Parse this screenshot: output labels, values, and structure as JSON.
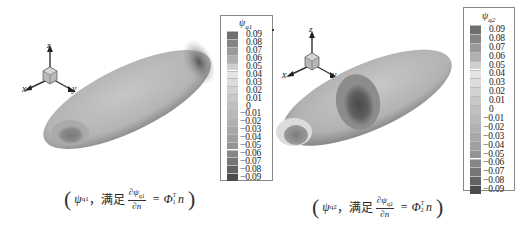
{
  "figure": {
    "panels": [
      {
        "id": "left",
        "colorbar": {
          "title_symbol": "ψ",
          "title_subscript": "q1",
          "ticks": [
            "0.09",
            "0.08",
            "0.07",
            "0.06",
            "0.05",
            "0.04",
            "0.03",
            "0.02",
            "0.01",
            "0",
            "−0.01",
            "−0.02",
            "−0.03",
            "−0.04",
            "−0.05",
            "−0.06",
            "−0.07",
            "−0.08",
            "−0.09"
          ],
          "colors": [
            "#6f6f6f",
            "#858585",
            "#9a9a9a",
            "#b0b0b0",
            "#cfcfcf",
            "#e4e4e4",
            "#dcdcdc",
            "#d2d2d2",
            "#c8c8c8",
            "#c0c0c0",
            "#b9b9b9",
            "#b1b1b1",
            "#a8a8a8",
            "#9f9f9f",
            "#949494",
            "#868686",
            "#767676",
            "#626262",
            "#4c4c4c"
          ]
        },
        "axes": {
          "x": "x",
          "y": "y",
          "z": "z"
        },
        "caption": {
          "open": "(",
          "symbol": "ψ",
          "subscript": "q1",
          "sep": "，满足",
          "frac_num": "∂ψ",
          "frac_num_sub": "q1",
          "frac_den": "∂n",
          "equals": "=",
          "rhs_symbol": "Φ",
          "rhs_sub": "1",
          "rhs_sup": "T",
          "rhs_tail": "n",
          "close": ")"
        }
      },
      {
        "id": "right",
        "colorbar": {
          "title_symbol": "ψ",
          "title_subscript": "q2",
          "ticks": [
            "0.09",
            "0.08",
            "0.07",
            "0.06",
            "0.05",
            "0.04",
            "0.03",
            "0.02",
            "0.01",
            "0",
            "−0.01",
            "−0.02",
            "−0.03",
            "−0.04",
            "−0.05",
            "−0.06",
            "−0.07",
            "−0.08",
            "−0.09"
          ],
          "colors": [
            "#6f6f6f",
            "#858585",
            "#9a9a9a",
            "#b0b0b0",
            "#cfcfcf",
            "#e4e4e4",
            "#dcdcdc",
            "#d2d2d2",
            "#c8c8c8",
            "#c0c0c0",
            "#b9b9b9",
            "#b1b1b1",
            "#a8a8a8",
            "#9f9f9f",
            "#949494",
            "#868686",
            "#767676",
            "#626262",
            "#4c4c4c"
          ]
        },
        "axes": {
          "x": "x",
          "y": "y",
          "z": "z"
        },
        "caption": {
          "open": "(",
          "symbol": "ψ",
          "subscript": "q2",
          "sep": "，满足",
          "frac_num": "∂ψ",
          "frac_num_sub": "q2",
          "frac_den": "∂n",
          "equals": "=",
          "rhs_symbol": "Φ",
          "rhs_sub": "2",
          "rhs_sup": "T",
          "rhs_tail": "n",
          "close": ")"
        }
      }
    ]
  }
}
